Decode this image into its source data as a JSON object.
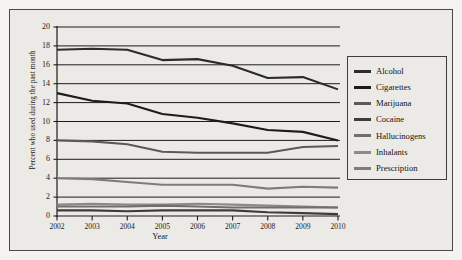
{
  "figure": {
    "background_color": "#eceae7",
    "frame_color": "#4a4a4a",
    "gridline_color": "#1c1c1c"
  },
  "chart_data": {
    "type": "line",
    "title": "",
    "xlabel": "Year",
    "ylabel": "Percent who used during the past month",
    "x": [
      2002,
      2003,
      2004,
      2005,
      2006,
      2007,
      2008,
      2009,
      2010
    ],
    "categories": [
      "2002",
      "2003",
      "2004",
      "2005",
      "2006",
      "2007",
      "2008",
      "2009",
      "2010"
    ],
    "xlim": [
      2002,
      2010
    ],
    "ylim": [
      0,
      20
    ],
    "yticks": [
      0,
      2,
      4,
      6,
      8,
      10,
      12,
      14,
      16,
      18,
      20
    ],
    "ytick_labels": [
      "0",
      "2",
      "4",
      "6",
      "8",
      "10",
      "12",
      "14",
      "16",
      "18",
      "20"
    ],
    "grid": "horizontal",
    "legend_position": "right",
    "series": [
      {
        "name": "Alcohol",
        "color": "#2b2b2b",
        "values": [
          17.6,
          17.7,
          17.6,
          16.5,
          16.6,
          15.9,
          14.6,
          14.7,
          13.4
        ]
      },
      {
        "name": "Cigarettes",
        "color": "#1c1c1c",
        "values": [
          13.0,
          12.2,
          11.9,
          10.8,
          10.4,
          9.8,
          9.1,
          8.9,
          8.0
        ]
      },
      {
        "name": "Marijuana",
        "color": "#5a5a5a",
        "values": [
          8.0,
          7.9,
          7.6,
          6.8,
          6.7,
          6.7,
          6.7,
          7.3,
          7.4
        ]
      },
      {
        "name": "Cocaine",
        "color": "#3c3c3c",
        "values": [
          0.6,
          0.6,
          0.5,
          0.6,
          0.6,
          0.6,
          0.4,
          0.3,
          0.2
        ]
      },
      {
        "name": "Hallucinogens",
        "color": "#6e6e6e",
        "values": [
          1.0,
          1.0,
          1.0,
          1.1,
          1.0,
          0.9,
          0.9,
          0.9,
          0.9
        ]
      },
      {
        "name": "Inhalants",
        "color": "#8a8a8a",
        "values": [
          1.2,
          1.3,
          1.2,
          1.2,
          1.3,
          1.2,
          1.1,
          1.0,
          0.9
        ]
      },
      {
        "name": "Prescription",
        "color": "#7c7c7c",
        "values": [
          4.0,
          3.9,
          3.6,
          3.3,
          3.3,
          3.3,
          2.9,
          3.1,
          3.0
        ]
      }
    ]
  },
  "legend": {
    "entries": [
      {
        "label": "Alcohol",
        "color": "#2b2b2b"
      },
      {
        "label": "Cigarettes",
        "color": "#1c1c1c"
      },
      {
        "label": "Marijuana",
        "color": "#5a5a5a"
      },
      {
        "label": "Cocaine",
        "color": "#3c3c3c"
      },
      {
        "label": "Hallucinogens",
        "color": "#6e6e6e"
      },
      {
        "label": "Inhalants",
        "color": "#8a8a8a"
      },
      {
        "label": "Prescription",
        "color": "#7c7c7c"
      }
    ]
  }
}
